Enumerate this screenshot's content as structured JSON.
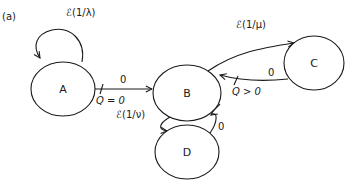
{
  "panel_label": "(a)",
  "nodes": {
    "A": {
      "label": "A"
    },
    "B": {
      "label": "B"
    },
    "C": {
      "label": "C"
    },
    "D": {
      "label": "D"
    }
  },
  "edges": {
    "A_self": {
      "label": "ℰ(1/λ)"
    },
    "A_to_B": {
      "label": "0",
      "guard": "Q = 0"
    },
    "B_to_C": {
      "label": "ℰ(1/μ)"
    },
    "C_to_B": {
      "label": "0",
      "guard": "Q > 0"
    },
    "B_to_D": {
      "label": "ℰ(1/ν)"
    },
    "D_to_B": {
      "label": "0",
      "guard": "Q = 0"
    }
  },
  "colors": {
    "stroke": "#1a1a1a",
    "background": "#ffffff"
  }
}
